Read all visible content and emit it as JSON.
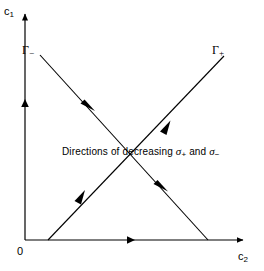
{
  "figure": {
    "background_color": "#ffffff",
    "line_color": "#000000",
    "width": 264,
    "height": 271
  },
  "axes": {
    "y": {
      "name": "c1",
      "label_base": "c",
      "label_sub": "1",
      "arrow": "up",
      "mid_arrow": "up"
    },
    "x": {
      "name": "c2",
      "label_base": "c",
      "label_sub": "2",
      "arrow": "right",
      "mid_arrow": "right"
    },
    "origin_label": "0"
  },
  "curves": [
    {
      "name": "gamma-minus",
      "label_base": "Γ",
      "label_sign": "−",
      "direction": "descending",
      "arrow_direction": "down-right",
      "arrow_count": 2,
      "start": [
        40,
        55
      ],
      "end": [
        208,
        240
      ]
    },
    {
      "name": "gamma-plus",
      "label_base": "Γ",
      "label_sign": "+",
      "direction": "ascending",
      "arrow_direction": "up-right",
      "arrow_count": 2,
      "start": [
        48,
        240
      ],
      "end": [
        224,
        56
      ]
    }
  ],
  "caption": {
    "prefix": "Directions of decreasing ",
    "symbol_1": "σ",
    "symbol_1_sign": "+",
    "conjunction": " and ",
    "symbol_2": "σ",
    "symbol_2_sign": "−",
    "full_text": "Directions of decreasing σ+ and σ−"
  }
}
